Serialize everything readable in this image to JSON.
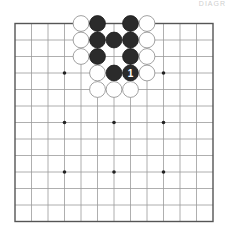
{
  "diagram": {
    "corner_label": "DIAGR",
    "board": {
      "lines": 13,
      "origin_x": 15,
      "origin_y": 23.5,
      "spacing": 16.5,
      "line_color": "#9a9a9a",
      "border_color": "#555555",
      "star_points": [
        [
          3,
          3
        ],
        [
          9,
          3
        ],
        [
          3,
          6
        ],
        [
          6,
          6
        ],
        [
          9,
          6
        ],
        [
          3,
          9
        ],
        [
          6,
          9
        ],
        [
          9,
          9
        ]
      ]
    },
    "stones": [
      {
        "color": "white",
        "col": 4,
        "row": 0
      },
      {
        "color": "black",
        "col": 5,
        "row": 0
      },
      {
        "color": "black",
        "col": 7,
        "row": 0
      },
      {
        "color": "white",
        "col": 8,
        "row": 0
      },
      {
        "color": "white",
        "col": 4,
        "row": 1
      },
      {
        "color": "black",
        "col": 5,
        "row": 1
      },
      {
        "color": "black",
        "col": 6,
        "row": 1
      },
      {
        "color": "black",
        "col": 7,
        "row": 1
      },
      {
        "color": "white",
        "col": 8,
        "row": 1
      },
      {
        "color": "white",
        "col": 4,
        "row": 2
      },
      {
        "color": "black",
        "col": 5,
        "row": 2
      },
      {
        "color": "black",
        "col": 7,
        "row": 2
      },
      {
        "color": "white",
        "col": 8,
        "row": 2
      },
      {
        "color": "white",
        "col": 5,
        "row": 3
      },
      {
        "color": "black",
        "col": 6,
        "row": 3
      },
      {
        "color": "black",
        "col": 7,
        "row": 3,
        "label": "1"
      },
      {
        "color": "white",
        "col": 8,
        "row": 3
      },
      {
        "color": "white",
        "col": 5,
        "row": 4
      },
      {
        "color": "white",
        "col": 6,
        "row": 4
      },
      {
        "color": "white",
        "col": 7,
        "row": 4
      }
    ]
  }
}
